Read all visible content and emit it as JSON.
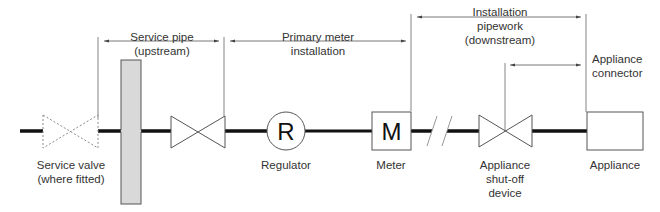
{
  "diagram": {
    "colors": {
      "pipe": "#111111",
      "outline": "#555555",
      "plate_fill": "#d9d9d9",
      "dotted_valve": "#8a8a8a",
      "text": "#333333"
    },
    "sections": [
      {
        "id": "service-pipe",
        "line1": "Service pipe",
        "line2": "(upstream)"
      },
      {
        "id": "primary-meter",
        "line1": "Primary meter",
        "line2": "installation"
      },
      {
        "id": "installation-pipework",
        "line1": "Installation",
        "line2": "pipework",
        "line3": "(downstream)"
      },
      {
        "id": "appliance-connector",
        "line1": "Appliance",
        "line2": "connector"
      }
    ],
    "components": [
      {
        "id": "service-valve",
        "line1": "Service valve",
        "line2": "(where fitted)",
        "style": "dotted"
      },
      {
        "id": "wall",
        "label": ""
      },
      {
        "id": "meter-control-valve",
        "label": ""
      },
      {
        "id": "regulator",
        "label": "Regulator",
        "symbol": "R"
      },
      {
        "id": "meter",
        "label": "Meter",
        "symbol": "M"
      },
      {
        "id": "appliance-shutoff",
        "line1": "Appliance",
        "line2": "shut-off",
        "line3": "device"
      },
      {
        "id": "appliance",
        "label": "Appliance"
      }
    ]
  }
}
